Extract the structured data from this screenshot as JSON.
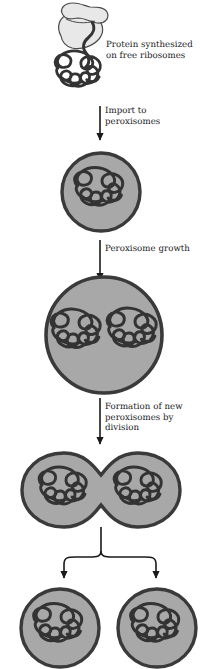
{
  "diagram": {
    "colors": {
      "background": "#ffffff",
      "membrane": "#3a3a3a",
      "lumen": "#a8a8a8",
      "protein": "#333333",
      "ribosome_fill": "#e8e8e8",
      "ribosome_outline": "#4a4a4a",
      "arrow": "#1a1a1a",
      "text": "#1a1a1a"
    },
    "labels": {
      "synthesis": "Protein synthesized\non free ribosomes",
      "import": "Import to\nperoxisomes",
      "growth": "Peroxisome growth",
      "division": "Formation of new\nperoxisomes by\ndivision"
    },
    "stages": [
      {
        "name": "free-ribosome-with-nascent-protein",
        "organelles": 0,
        "protein_tangles": 1,
        "has_ribosome": true
      },
      {
        "name": "small-peroxisome",
        "organelles": 1,
        "protein_tangles": 1,
        "has_ribosome": false
      },
      {
        "name": "enlarged-peroxisome",
        "organelles": 1,
        "protein_tangles": 2,
        "has_ribosome": false
      },
      {
        "name": "dividing-peroxisome",
        "organelles": 1,
        "protein_tangles": 2,
        "has_ribosome": false
      },
      {
        "name": "daughter-peroxisomes",
        "organelles": 2,
        "protein_tangles": 2,
        "has_ribosome": false
      }
    ]
  }
}
